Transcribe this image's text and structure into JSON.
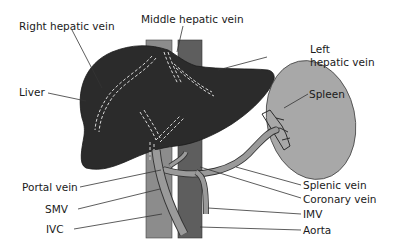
{
  "diagram": {
    "colors": {
      "liver": "#2b2b2b",
      "ivc": "#8c8c8c",
      "aorta": "#5e5e5e",
      "portal_system": "#9a9a9a",
      "spleen": "#a8a8a8",
      "dashed_vein": "#d8d8d8",
      "leader_line": "#333333",
      "text": "#1a1a1a"
    },
    "labels": {
      "right_hepatic_vein": "Right hepatic vein",
      "middle_hepatic_vein": "Middle hepatic vein",
      "left_hepatic_vein_line1": "Left",
      "left_hepatic_vein_line2": "hepatic vein",
      "liver": "Liver",
      "spleen": "Spleen",
      "portal_vein": "Portal vein",
      "smv": "SMV",
      "ivc": "IVC",
      "splenic_vein": "Splenic vein",
      "coronary_vein": "Coronary vein",
      "imv": "IMV",
      "aorta": "Aorta"
    }
  }
}
